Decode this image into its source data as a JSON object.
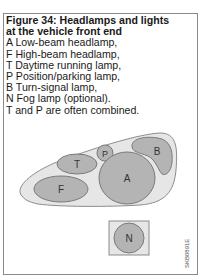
{
  "figure": {
    "title_line1": "Figure 34: Headlamps and lights",
    "title_line2": "at the vehicle front end",
    "legend": [
      {
        "key": "A",
        "text": "A Low-beam headlamp,"
      },
      {
        "key": "F",
        "text": "F High-beam headlamp,"
      },
      {
        "key": "T",
        "text": "T Daytime running lamp,"
      },
      {
        "key": "P",
        "text": "P Position/parking lamp,"
      },
      {
        "key": "B",
        "text": "B Turn-signal lamp,"
      },
      {
        "key": "N",
        "text": "N Fog lamp (optional)."
      }
    ],
    "note": "T and P are often combined.",
    "code": "SKB0891E"
  },
  "diagram": {
    "labels": {
      "A": "A",
      "F": "F",
      "T": "T",
      "P": "P",
      "B": "B",
      "N": "N"
    },
    "colors": {
      "housing_fill": "#e6e6e6",
      "housing_stroke": "#8c8c8c",
      "lamp_fill": "#b4b4b4",
      "lamp_stroke": "#7a7a7a",
      "label": "#333333",
      "frame": "#8a8a8a"
    }
  }
}
